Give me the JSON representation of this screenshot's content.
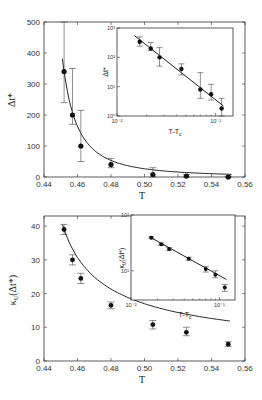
{
  "chart_data": [
    {
      "id": "top-main",
      "type": "scatter",
      "title": "",
      "xlabel": "T",
      "ylabel": "Δt*",
      "xlim": [
        0.44,
        0.56
      ],
      "ylim": [
        0,
        500
      ],
      "xticks": [
        0.44,
        0.46,
        0.48,
        0.5,
        0.52,
        0.54,
        0.56
      ],
      "xtick_labels": [
        "0.44",
        "0.46",
        "0.48",
        "0.50",
        "0.52",
        "0.54",
        "0.56"
      ],
      "yticks": [
        0,
        100,
        200,
        300,
        400,
        500
      ],
      "ytick_labels": [
        "0",
        "100",
        "200",
        "300",
        "400",
        "500"
      ],
      "grid": false,
      "series": [
        {
          "name": "data",
          "x": [
            0.452,
            0.457,
            0.462,
            0.48,
            0.505,
            0.525,
            0.55
          ],
          "y": [
            340,
            200,
            100,
            40,
            8,
            3,
            0
          ],
          "err_low": [
            240,
            170,
            50,
            30,
            0,
            0,
            0
          ],
          "err_high": [
            500,
            350,
            215,
            60,
            30,
            8,
            3
          ]
        },
        {
          "name": "fit",
          "kind": "line",
          "form": "power-law fit A*(T-Tc)^-gamma",
          "Tc": 0.435
        }
      ]
    },
    {
      "id": "top-inset",
      "type": "scatter",
      "scale": "log-log",
      "xlabel": "T-Tc",
      "ylabel": "Δt*",
      "xlim": [
        0.01,
        0.15
      ],
      "ylim": [
        1,
        1000
      ],
      "xtick_labels": [
        "10⁻²",
        "10⁻¹"
      ],
      "ytick_labels": [
        "10⁰",
        "10¹",
        "10²",
        "10³"
      ],
      "series": [
        {
          "name": "data",
          "x": [
            0.017,
            0.022,
            0.027,
            0.045,
            0.07,
            0.09,
            0.115
          ],
          "y": [
            340,
            200,
            100,
            40,
            8,
            5.5,
            1.8
          ],
          "err_low": [
            240,
            170,
            50,
            25,
            4,
            3.5,
            1.0
          ],
          "err_high": [
            500,
            320,
            215,
            60,
            30,
            12,
            4
          ]
        },
        {
          "name": "fit",
          "kind": "line",
          "x": [
            0.015,
            0.12
          ],
          "y": [
            550,
            2.2
          ]
        }
      ]
    },
    {
      "id": "bottom-main",
      "type": "scatter",
      "title": "",
      "xlabel": "T",
      "ylabel": "κU(Δt*)",
      "xlim": [
        0.44,
        0.56
      ],
      "ylim": [
        0,
        43
      ],
      "xticks": [
        0.44,
        0.46,
        0.48,
        0.5,
        0.52,
        0.54,
        0.56
      ],
      "xtick_labels": [
        "0.44",
        "0.46",
        "0.48",
        "0.50",
        "0.52",
        "0.54",
        "0.56"
      ],
      "yticks": [
        0,
        10,
        20,
        30,
        40
      ],
      "ytick_labels": [
        "0",
        "10",
        "20",
        "30",
        "40"
      ],
      "grid": false,
      "series": [
        {
          "name": "data",
          "x": [
            0.452,
            0.457,
            0.462,
            0.48,
            0.505,
            0.525,
            0.55
          ],
          "y": [
            39,
            30,
            24.5,
            16.5,
            10.8,
            8.5,
            5
          ],
          "err_low": [
            37.5,
            28.5,
            23,
            15.5,
            9.5,
            7.5,
            4.3
          ],
          "err_high": [
            40.5,
            31.5,
            26,
            17.5,
            12,
            10,
            5.7
          ]
        },
        {
          "name": "fit",
          "kind": "line",
          "form": "power-law fit A*(T-Tc)^-gamma",
          "Tc": 0.435
        }
      ]
    },
    {
      "id": "bottom-inset",
      "type": "scatter",
      "scale": "log-log",
      "xlabel": "T-Tc",
      "ylabel": "κU(Δt*)",
      "xlim": [
        0.01,
        0.15
      ],
      "ylim": [
        3,
        100
      ],
      "xtick_labels": [
        "10⁻²",
        "10⁻¹"
      ],
      "ytick_labels": [
        "10¹",
        "10²"
      ],
      "series": [
        {
          "name": "data",
          "x": [
            0.017,
            0.022,
            0.027,
            0.045,
            0.07,
            0.09,
            0.115
          ],
          "y": [
            39,
            30,
            24.5,
            16.5,
            10.8,
            8.5,
            5
          ],
          "err_low": [
            37.5,
            28.5,
            23,
            15.5,
            9.5,
            7.5,
            4.3
          ],
          "err_high": [
            40.5,
            31.5,
            26,
            17.5,
            12,
            10,
            5.7
          ]
        },
        {
          "name": "fit",
          "kind": "line",
          "x": [
            0.016,
            0.12
          ],
          "y": [
            41,
            7
          ]
        }
      ]
    }
  ]
}
